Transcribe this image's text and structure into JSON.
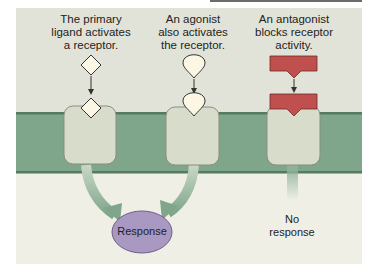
{
  "captions": {
    "primary": [
      "The primary",
      "ligand activates",
      "a receptor."
    ],
    "agonist": [
      "An agonist",
      "also activates",
      "the receptor."
    ],
    "antagonist": [
      "An antagonist",
      "blocks receptor",
      "activity."
    ]
  },
  "outcomes": {
    "response": "Response",
    "no_response_line1": "No",
    "no_response_line2": "response"
  },
  "colors": {
    "membrane": "#7fa58a",
    "membrane_edge": "#557a62",
    "receptor": "#d8dccb",
    "receptor_edge": "#8a8f80",
    "ligand": "#fbf7e4",
    "antagonist": "#c0504d",
    "response_fill": "#a898c2",
    "arrow": "#9ab39f"
  }
}
